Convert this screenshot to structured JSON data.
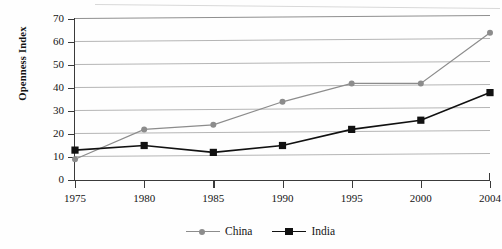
{
  "chart_data": {
    "type": "line",
    "title": "",
    "xlabel": "",
    "ylabel": "Openness Index",
    "categories": [
      "1975",
      "1980",
      "1985",
      "1990",
      "1995",
      "2000",
      "2004"
    ],
    "x": [
      1975,
      1980,
      1985,
      1990,
      1995,
      2000,
      2004
    ],
    "xlim": [
      1975,
      2004
    ],
    "ylim": [
      0,
      70
    ],
    "yticks": [
      0,
      10,
      20,
      30,
      40,
      50,
      60,
      70
    ],
    "ytick_labels": [
      "0",
      "10",
      "20",
      "30",
      "40",
      "50",
      "60",
      "70"
    ],
    "grid": true,
    "legend_position": "bottom-center",
    "series": [
      {
        "name": "China",
        "color": "#8c8c8c",
        "marker": "circle",
        "values": [
          9,
          22,
          24,
          34,
          42,
          42,
          64
        ]
      },
      {
        "name": "India",
        "color": "#111111",
        "marker": "square",
        "values": [
          13,
          15,
          12,
          15,
          22,
          26,
          38
        ]
      }
    ]
  },
  "axis": {
    "y_title": "Openness Index",
    "y_tick_labels": [
      "70",
      "60",
      "50",
      "40",
      "30",
      "20",
      "10",
      "0"
    ],
    "x_tick_labels": [
      "1975",
      "1980",
      "1985",
      "1990",
      "1995",
      "2000",
      "2004"
    ]
  },
  "legend": {
    "items": [
      {
        "label": "China",
        "color": "#8c8c8c",
        "marker": "circle-marker"
      },
      {
        "label": "India",
        "color": "#111111",
        "marker": "square-marker"
      }
    ]
  }
}
